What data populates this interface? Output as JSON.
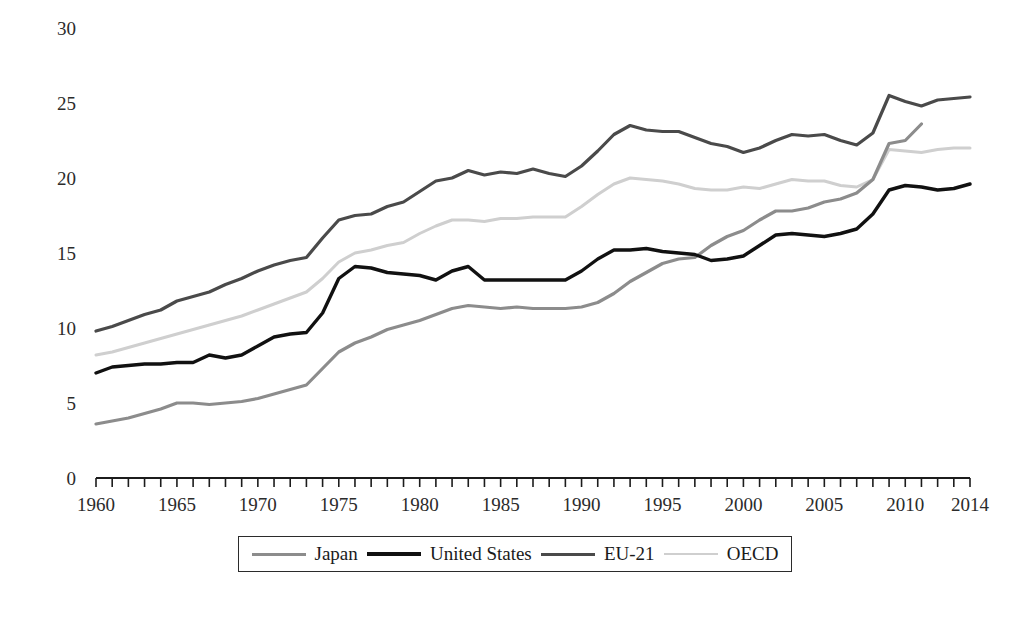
{
  "chart_data": {
    "type": "line",
    "title": "",
    "subtitle": "",
    "xlabel": "",
    "ylabel": "",
    "xlim": [
      1960,
      2014
    ],
    "ylim": [
      0,
      30
    ],
    "yticks": [
      0,
      5,
      10,
      15,
      20,
      25,
      30
    ],
    "xticks": [
      1960,
      1965,
      1970,
      1975,
      1980,
      1985,
      1990,
      1995,
      2000,
      2005,
      2010,
      2014
    ],
    "xtick_minor_every": 1,
    "grid": false,
    "legend_position": "bottom",
    "x": [
      1960,
      1961,
      1962,
      1963,
      1964,
      1965,
      1966,
      1967,
      1968,
      1969,
      1970,
      1971,
      1972,
      1973,
      1974,
      1975,
      1976,
      1977,
      1978,
      1979,
      1980,
      1981,
      1982,
      1983,
      1984,
      1985,
      1986,
      1987,
      1988,
      1989,
      1990,
      1991,
      1992,
      1993,
      1994,
      1995,
      1996,
      1997,
      1998,
      1999,
      2000,
      2001,
      2002,
      2003,
      2004,
      2005,
      2006,
      2007,
      2008,
      2009,
      2010,
      2011,
      2012,
      2013,
      2014
    ],
    "series": [
      {
        "name": "Japan",
        "color": "#8c8c8c",
        "width": 3.2,
        "values": [
          3.6,
          3.8,
          4.0,
          4.3,
          4.6,
          5.0,
          5.0,
          4.9,
          5.0,
          5.1,
          5.3,
          5.6,
          5.9,
          6.2,
          7.3,
          8.4,
          9.0,
          9.4,
          9.9,
          10.2,
          10.5,
          10.9,
          11.3,
          11.5,
          11.4,
          11.3,
          11.4,
          11.3,
          11.3,
          11.3,
          11.4,
          11.7,
          12.3,
          13.1,
          13.7,
          14.3,
          14.6,
          14.7,
          15.5,
          16.1,
          16.5,
          17.2,
          17.8,
          17.8,
          18.0,
          18.4,
          18.6,
          19.0,
          19.9,
          22.3,
          22.5,
          23.6,
          null,
          null,
          null
        ]
      },
      {
        "name": "United States",
        "color": "#111111",
        "width": 3.4,
        "values": [
          7.0,
          7.4,
          7.5,
          7.6,
          7.6,
          7.7,
          7.7,
          8.2,
          8.0,
          8.2,
          8.8,
          9.4,
          9.6,
          9.7,
          11.0,
          13.3,
          14.1,
          14.0,
          13.7,
          13.6,
          13.5,
          13.2,
          13.8,
          14.1,
          13.2,
          13.2,
          13.2,
          13.2,
          13.2,
          13.2,
          13.8,
          14.6,
          15.2,
          15.2,
          15.3,
          15.1,
          15.0,
          14.9,
          14.5,
          14.6,
          14.8,
          15.5,
          16.2,
          16.3,
          16.2,
          16.1,
          16.3,
          16.6,
          17.6,
          19.2,
          19.5,
          19.4,
          19.2,
          19.3,
          19.6
        ]
      },
      {
        "name": "EU-21",
        "color": "#4a4a4a",
        "width": 3.2,
        "values": [
          9.8,
          10.1,
          10.5,
          10.9,
          11.2,
          11.8,
          12.1,
          12.4,
          12.9,
          13.3,
          13.8,
          14.2,
          14.5,
          14.7,
          16.0,
          17.2,
          17.5,
          17.6,
          18.1,
          18.4,
          19.1,
          19.8,
          20.0,
          20.5,
          20.2,
          20.4,
          20.3,
          20.6,
          20.3,
          20.1,
          20.8,
          21.8,
          22.9,
          23.5,
          23.2,
          23.1,
          23.1,
          22.7,
          22.3,
          22.1,
          21.7,
          22.0,
          22.5,
          22.9,
          22.8,
          22.9,
          22.5,
          22.2,
          23.0,
          25.5,
          25.1,
          24.8,
          25.2,
          25.3,
          25.4
        ]
      },
      {
        "name": "OECD",
        "color": "#cfcfcf",
        "width": 3.0,
        "values": [
          8.2,
          8.4,
          8.7,
          9.0,
          9.3,
          9.6,
          9.9,
          10.2,
          10.5,
          10.8,
          11.2,
          11.6,
          12.0,
          12.4,
          13.3,
          14.4,
          15.0,
          15.2,
          15.5,
          15.7,
          16.3,
          16.8,
          17.2,
          17.2,
          17.1,
          17.3,
          17.3,
          17.4,
          17.4,
          17.4,
          18.1,
          18.9,
          19.6,
          20.0,
          19.9,
          19.8,
          19.6,
          19.3,
          19.2,
          19.2,
          19.4,
          19.3,
          19.6,
          19.9,
          19.8,
          19.8,
          19.5,
          19.4,
          19.9,
          21.9,
          21.8,
          21.7,
          21.9,
          22.0,
          22.0
        ]
      }
    ],
    "legend": [
      {
        "label": "Japan",
        "color": "#8c8c8c",
        "width": 3.2
      },
      {
        "label": "United States",
        "color": "#111111",
        "width": 4.0
      },
      {
        "label": "EU-21",
        "color": "#4a4a4a",
        "width": 3.6
      },
      {
        "label": "OECD",
        "color": "#cfcfcf",
        "width": 2.8
      }
    ]
  },
  "axis": {
    "y_labels": [
      "30",
      "25",
      "20",
      "15",
      "10",
      "5",
      "0"
    ],
    "x_labels": [
      "1960",
      "1965",
      "1970",
      "1975",
      "1980",
      "1985",
      "1990",
      "1995",
      "2000",
      "2005",
      "2010",
      "2014"
    ]
  }
}
